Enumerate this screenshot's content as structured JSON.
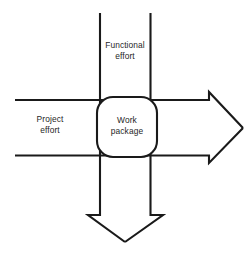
{
  "diagram": {
    "type": "matrix-organization-flow",
    "colors": {
      "stroke": "#1a1a1a",
      "background": "#ffffff",
      "node_fill": "#ffffff",
      "text": "#1f1f1f"
    },
    "arrows": [
      {
        "id": "functional-effort-arrow",
        "label": "Functional effort",
        "direction": "downward",
        "orientation": "vertical",
        "start": {
          "x": 100,
          "y": 13
        },
        "end": {
          "x": 125,
          "y": 242
        },
        "band_left_x": 100,
        "band_right_x": 150,
        "shaft_end_y": 215,
        "head_left_x": 88,
        "head_right_x": 163,
        "tip": {
          "x": 125,
          "y": 242
        }
      },
      {
        "id": "project-effort-arrow",
        "label": "Project effort",
        "direction": "rightward",
        "orientation": "horizontal",
        "start": {
          "x": 15,
          "y": 100
        },
        "end": {
          "x": 243,
          "y": 128
        },
        "band_top_y": 100,
        "band_bottom_y": 155,
        "shaft_end_x": 209,
        "head_top_y": 92,
        "head_bottom_y": 163,
        "tip": {
          "x": 243,
          "y": 128
        }
      }
    ],
    "node": {
      "id": "work-package-node",
      "label": "Work package",
      "shape": "rounded-square",
      "x": 97,
      "y": 97,
      "width": 60,
      "height": 60,
      "corner_radius": 16
    },
    "labels": {
      "functional_effort": "Functional\neffort",
      "project_effort": "Project\neffort",
      "work_package": "Work\npackage"
    }
  }
}
